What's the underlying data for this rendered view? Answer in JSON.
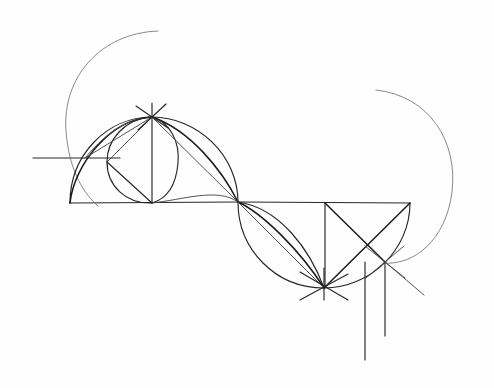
{
  "document": {
    "title": "Hand-drawn geometric construction",
    "medium": "pencil on paper",
    "background_color": "#fefefe",
    "ink_color": "#262628",
    "width": 494,
    "height": 388
  },
  "figure": {
    "key_points": {
      "left_baseline_start": [
        70,
        203
      ],
      "apex_point": [
        152,
        117
      ],
      "center_crossing": [
        238,
        202
      ],
      "right_baseline_end": [
        410,
        203
      ],
      "lower_star_point": [
        324,
        287
      ],
      "right_star_point": [
        385,
        262
      ],
      "left_ray_tip": [
        33,
        158
      ],
      "left_arc_top_tip": [
        158,
        31
      ],
      "right_arc_top_tip": [
        376,
        90
      ]
    }
  },
  "paths": {
    "baseline_left": "M 70 203 L 238 202",
    "baseline_right": "M 238 202 L 410 203",
    "left_ray": "M 33 158 L 120 158",
    "apex_vertical": "M 152 103 L 152 203",
    "big_arc_left": "M 158 31 C 100 33 62 78 66 131 C 69 172 85 195 98 206",
    "big_arc_right": "M 376 90 C 430 96 458 142 452 192 C 446 240 414 266 383 263",
    "semicircle_left": "M 70 203 C 70 155 107 117 152 117 C 197 117 238 155 238 202",
    "lobe_left_lower": "M 70 203 C 74 165 110 119 152 117",
    "lobe_left_upper_in": "M 85 158 C 110 128 130 119 152 117",
    "inner_circle_left": "M 152 117 C 124 119 107 140 107 162 C 107 186 126 204 152 203",
    "inner_circle_left_b": "M 152 117 C 170 122 180 142 178 163 C 176 186 166 199 152 203",
    "lens_left_lower": "M 152 117 C 190 130 222 170 238 202",
    "lens_left_lower_b": "M 152 203 C 182 200 218 187 238 202",
    "chord_apex_to_right": "M 152 117 L 238 202",
    "chord_apex_to_bottomleft": "M 152 117 L 107 162",
    "chord_bottomleft_to_base": "M 107 162 L 152 203",
    "chord_apex_to_left": "M 152 117 L 85 158",
    "semicircle_right": "M 238 202 C 238 250 276 288 324 288 C 370 288 410 250 410 203",
    "lobe_right_upper": "M 238 202 C 262 213 300 250 324 288",
    "lobe_right_inner": "M 238 202 C 280 208 310 250 324 288",
    "lens_right_chord": "M 238 202 L 324 288",
    "right_vertical_325": "M 325 203 L 325 288",
    "right_diag_a": "M 325 203 L 385 262",
    "right_diag_b": "M 410 203 L 324 288",
    "right_diag_c": "M 324 288 L 410 203",
    "star_rays_lower": [
      "M 300 272 L 348 300",
      "M 348 274 L 300 300",
      "M 324 268 L 324 300"
    ],
    "star_rays_right": [
      "M 365 246 L 405 278",
      "M 404 246 L 366 278"
    ],
    "plumb_long": "M 365 262 L 365 360",
    "plumb_short": "M 385 262 L 385 336",
    "ray_lower_right": "M 385 262 L 424 295",
    "apex_star_rays": [
      "M 136 106 L 168 128",
      "M 166 104 L 138 130"
    ]
  },
  "labels": {
    "none_visible": ""
  }
}
